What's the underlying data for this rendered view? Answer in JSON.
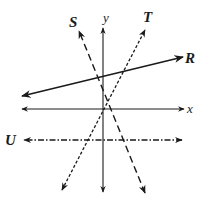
{
  "diagram": {
    "type": "coordinate-plane-lines",
    "axes": {
      "x_label": "x",
      "y_label": "y",
      "origin_px": [
        103,
        109
      ]
    },
    "lines": [
      {
        "id": "R",
        "label": "R",
        "style": "solid",
        "from": [
          22,
          96
        ],
        "to": [
          183,
          57
        ],
        "label_pos": [
          185,
          62
        ]
      },
      {
        "id": "S",
        "label": "S",
        "style": "long-dashed",
        "from": [
          145,
          193
        ],
        "to": [
          79,
          31
        ],
        "label_pos": [
          69,
          27
        ]
      },
      {
        "id": "T",
        "label": "T",
        "style": "short-dashed",
        "from": [
          62,
          190
        ],
        "to": [
          145,
          30
        ],
        "label_pos": [
          144,
          21
        ]
      },
      {
        "id": "U",
        "label": "U",
        "style": "dash-dot",
        "from": [
          182,
          140
        ],
        "to": [
          24,
          140
        ],
        "label_pos": [
          6,
          145
        ]
      }
    ],
    "colors": {
      "ink": "#1a1a1a",
      "background": "#ffffff"
    }
  }
}
